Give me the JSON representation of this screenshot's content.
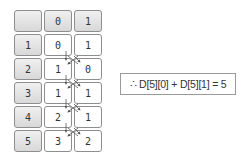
{
  "table": {
    "header": [
      "",
      "0",
      "1"
    ],
    "rows": [
      {
        "index": "1",
        "values": [
          "0",
          "1"
        ]
      },
      {
        "index": "2",
        "values": [
          "1",
          "0"
        ]
      },
      {
        "index": "3",
        "values": [
          "1",
          "1"
        ]
      },
      {
        "index": "4",
        "values": [
          "2",
          "1"
        ]
      },
      {
        "index": "5",
        "values": [
          "3",
          "2"
        ]
      }
    ]
  },
  "result": {
    "text": "∴ D[5][0] + D[5][1] = 5"
  },
  "colors": {
    "header_bg": "#dcdcdc",
    "border": "#8e8e8e",
    "arrow": "#555555"
  }
}
